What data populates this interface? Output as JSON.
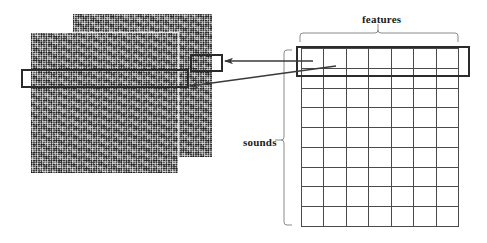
{
  "figure": {
    "type": "diagram",
    "title": "",
    "background_color": "#ffffff"
  },
  "labels": {
    "features": "features",
    "sounds": "sounds"
  },
  "matrix": {
    "name": "sounds-by-features-matrix",
    "columns": 7,
    "rows": 9,
    "column_axis_label": "features",
    "row_axis_label": "sounds",
    "highlighted_row_index": 0,
    "cell_fill": "#ffffff",
    "line_color": "#4a4a4a"
  },
  "images": {
    "back": {
      "name": "noise-image-back",
      "x": 73,
      "y": 14,
      "width": 139,
      "height": 143,
      "highlight": {
        "x": 190,
        "y": 54,
        "width": 29,
        "height": 14
      }
    },
    "front": {
      "name": "noise-image-front",
      "x": 31,
      "y": 33,
      "width": 147,
      "height": 140,
      "highlight": {
        "x": 21,
        "y": 69,
        "width": 164,
        "height": 15
      }
    }
  },
  "annotations": {
    "highlight_stroke": "#2b2b2b",
    "brace_stroke": "#777777",
    "arrow_stroke": "#3a3a3a",
    "arrows": [
      {
        "name": "arrow-to-back-image-row",
        "from": "matrix-row",
        "to": "noise-image-back-highlight"
      },
      {
        "name": "arrow-to-front-image-row",
        "from": "matrix-row",
        "to": "noise-image-front-highlight"
      }
    ],
    "braces": [
      {
        "name": "features-brace",
        "orientation": "horizontal",
        "label": "features"
      },
      {
        "name": "sounds-brace",
        "orientation": "vertical",
        "label": "sounds"
      }
    ]
  }
}
